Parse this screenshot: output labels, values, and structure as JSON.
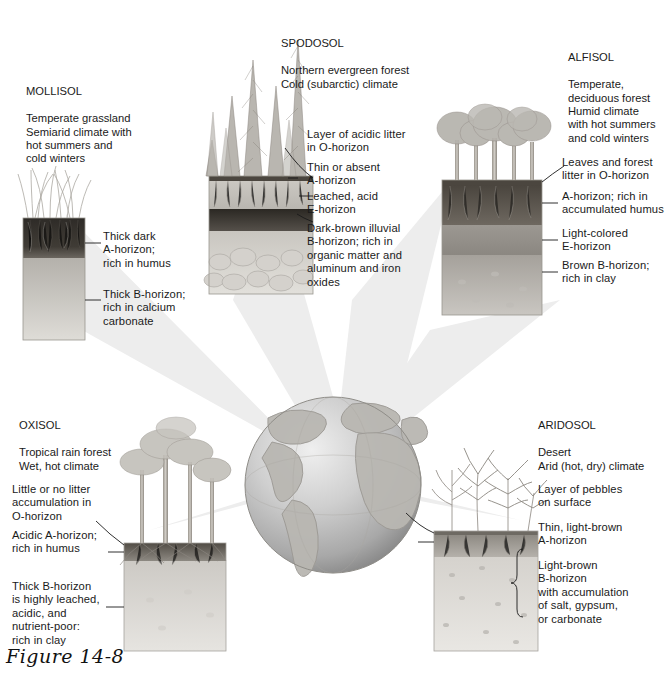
{
  "figure": {
    "caption": "Figure 14-8",
    "center_icon": "globe-icon"
  },
  "soils": [
    {
      "id": "mollisol",
      "name": "MOLLISOL",
      "description": "Temperate grassland\nSemiarid climate with\nhot summers and\ncold winters",
      "vegetation_icon": "grass-icon",
      "annotations": [
        "Thick dark\nA-horizon;\nrich in humus",
        "Thick B-horizon;\nrich in calcium\ncarbonate"
      ]
    },
    {
      "id": "spodosol",
      "name": "SPODOSOL",
      "description": "Northern evergreen forest\nCold (subarctic) climate",
      "vegetation_icon": "conifer-forest-icon",
      "annotations": [
        "Layer of acidic litter\nin O-horizon",
        "Thin or absent\nA-horizon",
        "Leached, acid\nE-horizon",
        "Dark-brown illuvial\nB-horizon; rich in\norganic matter and\naluminum and iron\noxides"
      ]
    },
    {
      "id": "alfisol",
      "name": "ALFISOL",
      "description": "Temperate,\ndeciduous forest\nHumid climate\nwith hot summers\nand cold winters",
      "vegetation_icon": "deciduous-forest-icon",
      "annotations": [
        "Leaves and forest\nlitter in O-horizon",
        "A-horizon; rich in\naccumulated humus",
        "Light-colored\nE-horizon",
        "Brown B-horizon;\nrich in clay"
      ]
    },
    {
      "id": "oxisol",
      "name": "OXISOL",
      "description": "Tropical rain forest\nWet, hot climate",
      "vegetation_icon": "rainforest-icon",
      "annotations": [
        "Little or no litter\naccumulation in\nO-horizon",
        "Acidic A-horizon;\nrich in humus",
        "Thick B-horizon\nis highly leached,\nacidic, and\nnutrient-poor:\nrich in clay"
      ]
    },
    {
      "id": "aridosol",
      "name": "ARIDOSOL",
      "description": "Desert\nArid (hot, dry) climate",
      "vegetation_icon": "desert-plants-icon",
      "annotations": [
        "Layer of pebbles\non surface",
        "Thin, light-brown\nA-horizon",
        "Light-brown\nB-horizon\nwith accumulation\nof salt, gypsum,\nor carbonate"
      ]
    }
  ],
  "colors": {
    "text": "#1a1a1a",
    "ray": "#ededed",
    "globe_light": "#e8e8e8",
    "globe_dark": "#8e8e8e",
    "dark_horizon": "#3a3631",
    "mid_horizon": "#8d8a85",
    "light_horizon": "#d9d7d2",
    "leader_line": "#1a1a1a"
  }
}
